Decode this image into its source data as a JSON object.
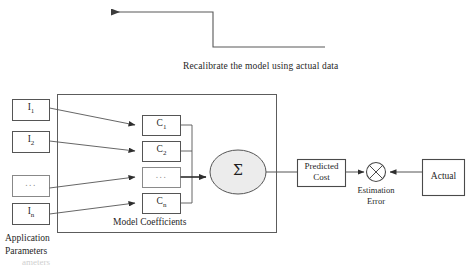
{
  "diagram": {
    "title_caption": "Recalibrate the model using actual data",
    "colors": {
      "stroke": "#4a4a4a",
      "text": "#1f1f1f",
      "ellipse_fill": "#ececec",
      "box_fill": "#ffffff",
      "faint_text": "#d0d0d0"
    },
    "inputs": {
      "group_label_line1": "Application",
      "group_label_line2": "Parameters",
      "items": [
        {
          "name": "input-1",
          "base": "I",
          "sub": "1"
        },
        {
          "name": "input-2",
          "base": "I",
          "sub": "2"
        },
        {
          "name": "input-ellipsis",
          "base": "...",
          "sub": ""
        },
        {
          "name": "input-n",
          "base": "I",
          "sub": "n"
        }
      ]
    },
    "model": {
      "group_label": "Model Coefficients",
      "coefficients": [
        {
          "name": "coefficient-1",
          "base": "C",
          "sub": "1"
        },
        {
          "name": "coefficient-2",
          "base": "C",
          "sub": "2"
        },
        {
          "name": "coefficient-ellipsis",
          "base": "...",
          "sub": ""
        },
        {
          "name": "coefficient-n",
          "base": "C",
          "sub": "n"
        }
      ],
      "summation_symbol": "Σ"
    },
    "outputs": {
      "predicted_cost_line1": "Predicted",
      "predicted_cost_line2": "Cost",
      "actual_label": "Actual",
      "error_label_line1": "Estimation",
      "error_label_line2": "Error",
      "comparator_symbol": "x"
    },
    "footer_ghost_text": "ameters"
  }
}
